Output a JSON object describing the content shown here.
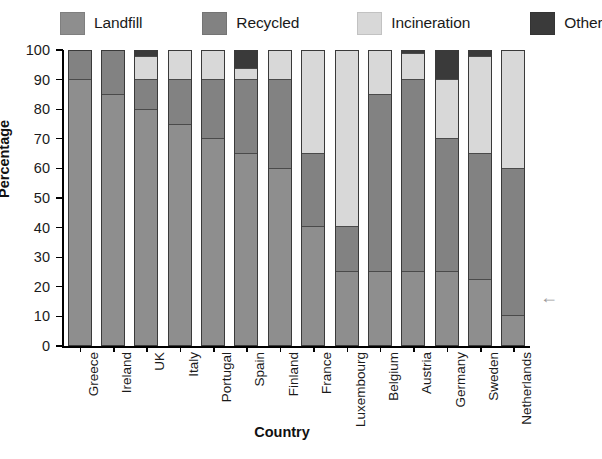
{
  "chart_data": {
    "type": "bar",
    "subtype": "stacked-bar-100",
    "title": "",
    "xlabel": "Country",
    "ylabel": "Percentage",
    "ylim": [
      0,
      100
    ],
    "yticks": [
      0,
      10,
      20,
      30,
      40,
      50,
      60,
      70,
      80,
      90,
      100
    ],
    "grid": false,
    "legend_position": "top",
    "categories": [
      "Greece",
      "Ireland",
      "UK",
      "Italy",
      "Portugal",
      "Spain",
      "Finland",
      "France",
      "Luxembourg",
      "Belgium",
      "Austria",
      "Germany",
      "Sweden",
      "Netherlands"
    ],
    "series": [
      {
        "name": "Landfill",
        "color": "#8e8e8e",
        "values": [
          90,
          85,
          80,
          75,
          70,
          65,
          60,
          40,
          25,
          25,
          25,
          25,
          22,
          10
        ]
      },
      {
        "name": "Recycled",
        "color": "#828282",
        "values": [
          10,
          15,
          10,
          15,
          20,
          25,
          30,
          25,
          15,
          60,
          65,
          45,
          43,
          50
        ]
      },
      {
        "name": "Incineration",
        "color": "#d8d8d8",
        "values": [
          0,
          0,
          8,
          10,
          10,
          4,
          10,
          35,
          60,
          15,
          9,
          20,
          33,
          40
        ]
      },
      {
        "name": "Other",
        "color": "#3a3a3a",
        "values": [
          0,
          0,
          2,
          0,
          0,
          6,
          0,
          0,
          0,
          0,
          1,
          10,
          2,
          0
        ]
      }
    ]
  },
  "legend": {
    "items": [
      {
        "label": "Landfill",
        "color": "#8e8e8e"
      },
      {
        "label": "Recycled",
        "color": "#828282"
      },
      {
        "label": "Incineration",
        "color": "#d8d8d8"
      },
      {
        "label": "Other",
        "color": "#3a3a3a"
      }
    ]
  },
  "axes": {
    "y_title": "Percentage",
    "x_title": "Country",
    "y_tick_labels": [
      "0",
      "10",
      "20",
      "30",
      "40",
      "50",
      "60",
      "70",
      "80",
      "90",
      "100"
    ]
  },
  "annotations": {
    "side_arrow": "←"
  }
}
